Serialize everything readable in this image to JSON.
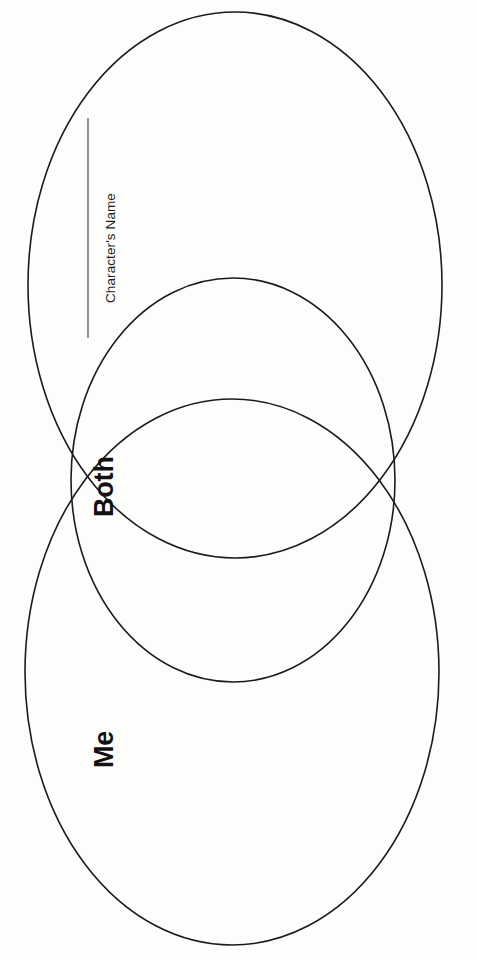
{
  "page": {
    "background_color": "#fdfdfb",
    "width": 477,
    "height": 960,
    "orientation": "rotated-90-counterclockwise"
  },
  "diagram": {
    "type": "venn-diagram",
    "stroke_color": "#1b1b1b",
    "fill_color": "none",
    "ellipses": [
      {
        "name": "character-ellipse",
        "label": "Character's Name",
        "cx": 235,
        "cy": 285,
        "rx": 207,
        "ry": 273
      },
      {
        "name": "both-ellipse",
        "label": "Both",
        "cx": 233,
        "cy": 480,
        "rx": 162,
        "ry": 202
      },
      {
        "name": "me-ellipse",
        "label": "Me",
        "cx": 232,
        "cy": 672,
        "rx": 207,
        "ry": 273
      }
    ],
    "write_on_line": {
      "name": "character-name-line",
      "x": 88,
      "y_start": 118,
      "y_end": 338,
      "color": "#4a4a4a"
    }
  },
  "labels": {
    "character_name": "Character's Name",
    "both": "Both",
    "me": "Me"
  }
}
